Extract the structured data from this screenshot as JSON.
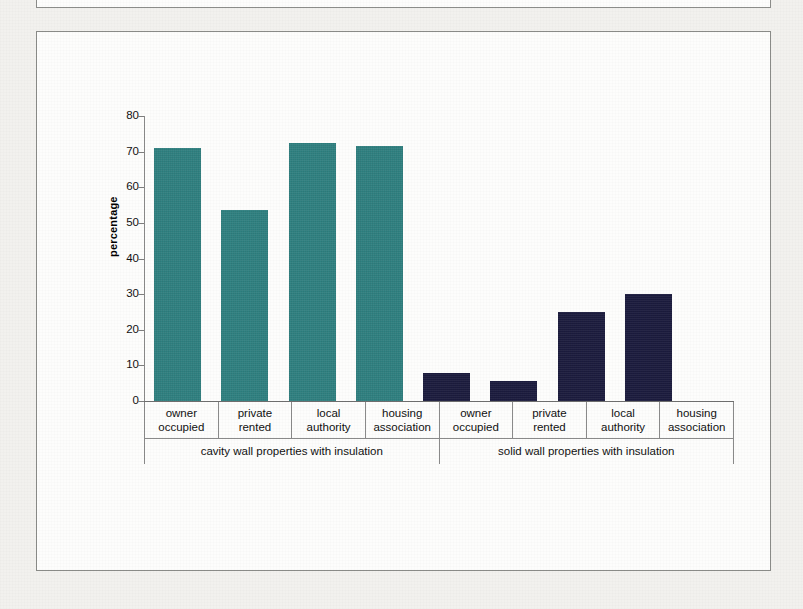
{
  "page": {
    "background_color": "#f2f1ee",
    "panel_color": "#fdfdfc",
    "border_color": "#8a8b88"
  },
  "chart_data": {
    "type": "bar",
    "title": "",
    "xlabel": "",
    "ylabel": "percentage",
    "ylim": [
      0,
      80
    ],
    "ytick_step": 10,
    "yticks": [
      "80",
      "70",
      "60",
      "50",
      "40",
      "30",
      "20",
      "10",
      "0"
    ],
    "grid": false,
    "legend": "none",
    "categories": [
      "owner occupied",
      "private rented",
      "local authority",
      "housing association",
      "owner occupied",
      "private rented",
      "local authority",
      "housing association"
    ],
    "category_lines": [
      [
        "owner",
        "occupied"
      ],
      [
        "private",
        "rented"
      ],
      [
        "local",
        "authority"
      ],
      [
        "housing",
        "association"
      ],
      [
        "owner",
        "occupied"
      ],
      [
        "private",
        "rented"
      ],
      [
        "local",
        "authority"
      ],
      [
        "housing",
        "association"
      ]
    ],
    "values": [
      71,
      53.5,
      72.5,
      71.5,
      8,
      5.5,
      25,
      30
    ],
    "bar_colors": [
      "#2f8181",
      "#2f8181",
      "#2f8181",
      "#2f8181",
      "#1b1b3e",
      "#1b1b3e",
      "#1b1b3e",
      "#1b1b3e"
    ],
    "groups": [
      {
        "label": "cavity wall properties with insulation",
        "span": 4,
        "color": "#2f8181"
      },
      {
        "label": "solid wall properties with insulation",
        "span": 4,
        "color": "#1b1b3e"
      }
    ]
  }
}
